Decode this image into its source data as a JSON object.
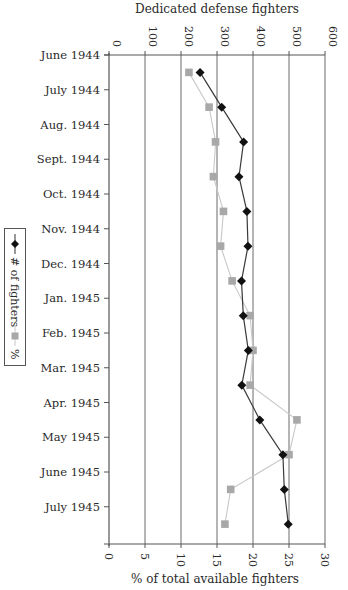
{
  "chart_data": {
    "type": "line",
    "orientation": "horizontal",
    "categories": [
      "June 1944",
      "July 1944",
      "Aug. 1944",
      "Sept. 1944",
      "Oct. 1944",
      "Nov. 1944",
      "Dec. 1944",
      "Jan. 1945",
      "Feb. 1945",
      "Mar. 1945",
      "Apr. 1945",
      "May 1945",
      "June 1945",
      "July 1945"
    ],
    "top_axis": {
      "label": "Dedicated defense fighters",
      "range": [
        0,
        600
      ],
      "ticks": [
        0,
        100,
        200,
        300,
        400,
        500,
        600
      ],
      "tick_labels": [
        "0",
        "100",
        "200",
        "300",
        "400",
        "500",
        "600"
      ]
    },
    "bottom_axis": {
      "label": "% of total available fighters",
      "range": [
        0,
        30
      ],
      "ticks": [
        0,
        5,
        10,
        15,
        20,
        25,
        30
      ],
      "tick_labels": [
        "0",
        "5",
        "10",
        "15",
        "20",
        "25",
        "30"
      ]
    },
    "series": [
      {
        "name": "# of fighters",
        "axis": "top",
        "marker": "diamond",
        "color": "#111111",
        "line_color": "#3a3a3a",
        "values": [
          253,
          313,
          374,
          361,
          383,
          386,
          368,
          373,
          387,
          369,
          419,
          483,
          487,
          498
        ]
      },
      {
        "name": "%",
        "axis": "bottom",
        "marker": "square",
        "color": "#a8a8a8",
        "line_color": "#c8c8c8",
        "values": [
          11.1,
          13.9,
          14.8,
          14.5,
          15.9,
          15.5,
          17.1,
          19.6,
          20.0,
          19.6,
          26.1,
          25.0,
          16.9,
          16.1
        ]
      }
    ],
    "grid": "vertical",
    "legend": {
      "placement": "left",
      "entries": [
        "# of fighters",
        "%"
      ]
    }
  }
}
